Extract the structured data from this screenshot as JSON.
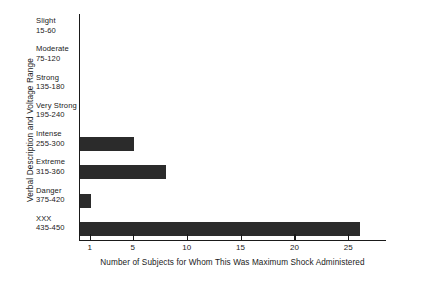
{
  "chart_data": {
    "type": "bar",
    "orientation": "horizontal",
    "title": "",
    "xlabel": "Number of Subjects for Whom This Was Maximum Shock Administered",
    "ylabel": "Verbal Description and Voltage Range",
    "categories": [
      "Slight",
      "Moderate",
      "Strong",
      "Very Strong",
      "Intense",
      "Extreme",
      "Danger",
      "XXX"
    ],
    "category_ranges": [
      "15-60",
      "75-120",
      "135-180",
      "195-240",
      "255-300",
      "315-360",
      "375-420",
      "435-450"
    ],
    "values": [
      0,
      0,
      0,
      0,
      5,
      8,
      1,
      26
    ],
    "xticks": [
      1,
      5,
      10,
      15,
      20,
      25
    ],
    "xlim": [
      0,
      28.5
    ],
    "grid": false,
    "legend": false,
    "bar_color": "#2b2b2b",
    "axis_color": "#1a1a1a"
  }
}
